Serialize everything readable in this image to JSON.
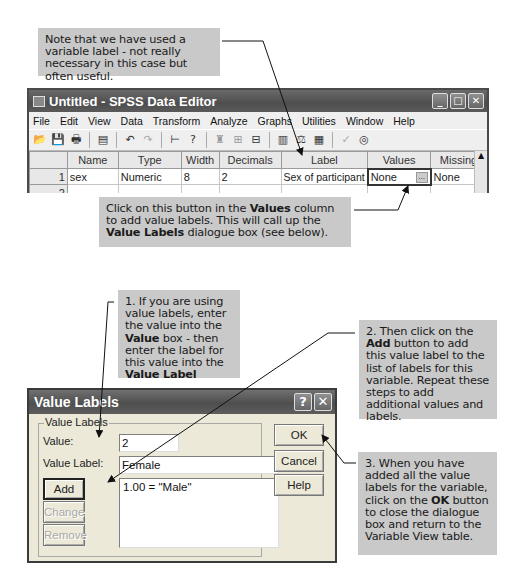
{
  "notes": {
    "variable_label": "Note that we have used a variable label - not really necessary in this case but often useful.",
    "values_button": {
      "prefix": "Click on this button in the ",
      "bold1": "Values",
      "middle": " column to add value labels. This will call up the ",
      "bold2": "Value Labels",
      "suffix": " dialogue box (see below)."
    },
    "step1": {
      "prefix": "1. If you are using value labels, enter the value into the ",
      "bold1": "Value",
      "middle": " box - then enter the label for this value into the ",
      "bold2": "Value Label"
    },
    "step2": {
      "prefix": "2. Then click on the ",
      "bold1": "Add",
      "suffix": " button to add this value label to the list of labels for this variable. Repeat these steps to add additional values and labels."
    },
    "step3": {
      "prefix": "3. When you have added all the value labels for the variable, click on the ",
      "bold1": "OK",
      "suffix": " button to close the dialogue box and return to the Variable View table."
    }
  },
  "spss_window": {
    "title": "Untitled - SPSS Data Editor",
    "title_buttons": {
      "minimize": "_",
      "maximize": "□",
      "close": "✕"
    },
    "menu": [
      "File",
      "Edit",
      "View",
      "Data",
      "Transform",
      "Analyze",
      "Graphs",
      "Utilities",
      "Window",
      "Help"
    ],
    "toolbar_icons": [
      "open-icon",
      "save-icon",
      "print-icon",
      "dialog-recall-icon",
      "undo-icon",
      "redo-icon",
      "goto-case-icon",
      "variables-icon",
      "find-icon",
      "insert-case-icon",
      "insert-variable-icon",
      "split-file-icon",
      "weight-cases-icon",
      "select-cases-icon",
      "value-labels-icon",
      "use-sets-icon"
    ],
    "grid": {
      "columns": [
        "",
        "Name",
        "Type",
        "Width",
        "Decimals",
        "Label",
        "Values",
        "Missing"
      ],
      "rows": [
        {
          "num": "1",
          "name": "sex",
          "type": "Numeric",
          "width": "8",
          "decimals": "2",
          "label": "Sex of participant",
          "values": "None",
          "missing": "None"
        },
        {
          "num": "2",
          "name": "",
          "type": "",
          "width": "",
          "decimals": "",
          "label": "",
          "values": "",
          "missing": ""
        }
      ],
      "values_button_glyph": "..."
    }
  },
  "value_labels_dialog": {
    "title": "Value Labels",
    "title_buttons": {
      "help": "?",
      "close": "✕"
    },
    "group_label": "Value Labels",
    "value_label_text": "Value:",
    "value_input": "2",
    "value_label_field_text": "Value Label:",
    "value_label_input": "Female",
    "list_items": [
      "1.00 = \"Male\""
    ],
    "buttons": {
      "add": "Add",
      "change": "Change",
      "remove": "Remove",
      "ok": "OK",
      "cancel": "Cancel",
      "help": "Help"
    }
  }
}
